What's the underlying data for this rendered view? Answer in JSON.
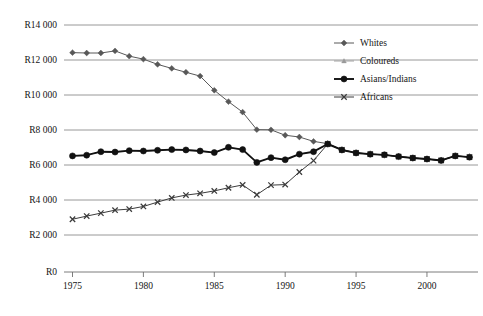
{
  "chart_data": {
    "type": "line",
    "title": "",
    "xlabel": "",
    "ylabel": "",
    "currency_prefix": "R",
    "x": [
      1975,
      1976,
      1977,
      1978,
      1979,
      1980,
      1981,
      1982,
      1983,
      1984,
      1985,
      1986,
      1987,
      1988,
      1989,
      1990,
      1991,
      1992,
      1993,
      1994,
      1995,
      1996,
      1997,
      1998,
      1999,
      2000,
      2001,
      2002,
      2003
    ],
    "xlim": [
      1974.4,
      2003.6
    ],
    "ylim": [
      0,
      14000
    ],
    "y_ticks": [
      0,
      2000,
      4000,
      6000,
      8000,
      10000,
      12000,
      14000
    ],
    "y_tick_labels": [
      "R0",
      "R2 000",
      "R4 000",
      "R6 000",
      "R8 000",
      "R10 000",
      "R12 000",
      "R14 000"
    ],
    "y_axis_broken": true,
    "y_axis_break_note": "R0 baseline sits below the evenly spaced R2 000-R14 000 gridlines",
    "x_ticks": [
      1975,
      1980,
      1985,
      1990,
      1995,
      2000
    ],
    "x_tick_labels": [
      "1975",
      "1980",
      "1985",
      "1990",
      "1995",
      "2000"
    ],
    "grid": true,
    "grid_axis": "y",
    "legend_position": "upper-right",
    "series": [
      {
        "name": "Whites",
        "marker": "diamond",
        "color": "#585858",
        "line_width": 1.0,
        "values": [
          12420,
          12400,
          12400,
          12520,
          12220,
          12050,
          11750,
          11520,
          11300,
          11080,
          10270,
          9620,
          9020,
          8020,
          8010,
          7700,
          7600,
          7350,
          7220,
          6870,
          6700,
          6620,
          6580,
          6490,
          6400,
          6340,
          6270,
          6520,
          6460
        ]
      },
      {
        "name": "Coloureds",
        "marker": "triangle",
        "color": "#9a9a9a",
        "line_width": 0.9,
        "values": [
          6520,
          6560,
          6760,
          6740,
          6820,
          6800,
          6840,
          6880,
          6860,
          6800,
          6710,
          7010,
          6880,
          6150,
          6420,
          6300,
          6620,
          6760,
          7200,
          6860,
          6690,
          6620,
          6580,
          6480,
          6400,
          6340,
          6260,
          6520,
          6450
        ]
      },
      {
        "name": "Asians/Indians",
        "marker": "circle",
        "color": "#111111",
        "line_width": 1.9,
        "values": [
          6520,
          6560,
          6760,
          6740,
          6820,
          6800,
          6840,
          6880,
          6860,
          6800,
          6710,
          7010,
          6880,
          6150,
          6420,
          6300,
          6620,
          6760,
          7200,
          6860,
          6690,
          6620,
          6580,
          6480,
          6400,
          6340,
          6260,
          6520,
          6450
        ]
      },
      {
        "name": "Africans",
        "marker": "cross",
        "color": "#3c3c3c",
        "line_width": 1.0,
        "values": [
          2900,
          3080,
          3250,
          3420,
          3480,
          3630,
          3880,
          4120,
          4280,
          4380,
          4520,
          4700,
          4860,
          4300,
          4850,
          4880,
          5600,
          6250,
          7200,
          6860,
          6690,
          6620,
          6580,
          6480,
          6400,
          6340,
          6260,
          6520,
          6450
        ]
      }
    ]
  },
  "legend": {
    "items": [
      {
        "label": "Whites"
      },
      {
        "label": "Coloureds"
      },
      {
        "label": "Asians/Indians"
      },
      {
        "label": "Africans"
      }
    ]
  },
  "colors": {
    "grid": "#8d8d8d",
    "axis": "#6e6e6e",
    "text": "#141414",
    "background": "#ffffff"
  }
}
